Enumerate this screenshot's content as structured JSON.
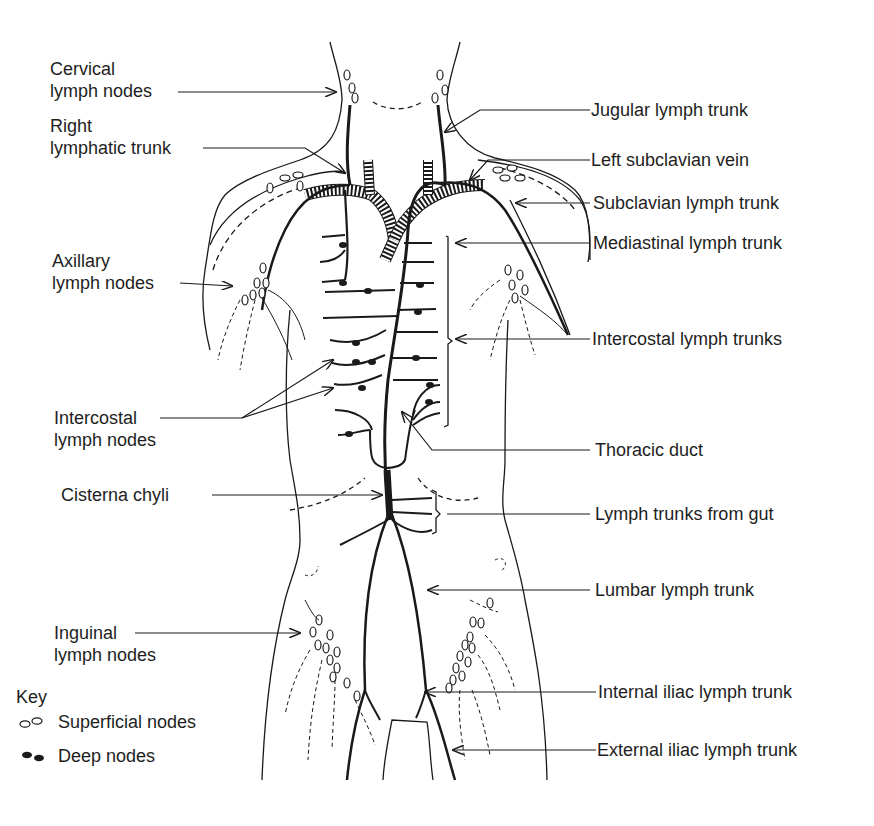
{
  "diagram": {
    "labels_left": [
      {
        "id": "cervical",
        "line1": "Cervical",
        "line2": "lymph nodes"
      },
      {
        "id": "right-lymphatic-trunk",
        "line1": "Right",
        "line2": "lymphatic trunk"
      },
      {
        "id": "axillary",
        "line1": "Axillary",
        "line2": "lymph nodes"
      },
      {
        "id": "intercostal-nodes",
        "line1": "Intercostal",
        "line2": "lymph nodes"
      },
      {
        "id": "cisterna-chyli",
        "line1": "Cisterna chyli"
      },
      {
        "id": "inguinal",
        "line1": "Inguinal",
        "line2": "lymph nodes"
      }
    ],
    "labels_right": [
      {
        "id": "jugular",
        "text": "Jugular lymph trunk"
      },
      {
        "id": "left-subclavian-vein",
        "text": "Left subclavian vein"
      },
      {
        "id": "subclavian-trunk",
        "text": "Subclavian lymph trunk"
      },
      {
        "id": "mediastinal",
        "text": "Mediastinal lymph trunk"
      },
      {
        "id": "intercostal-trunks",
        "text": "Intercostal lymph trunks"
      },
      {
        "id": "thoracic-duct",
        "text": "Thoracic duct"
      },
      {
        "id": "gut-trunks",
        "text": "Lymph trunks from gut"
      },
      {
        "id": "lumbar",
        "text": "Lumbar lymph trunk"
      },
      {
        "id": "internal-iliac",
        "text": "Internal iliac lymph trunk"
      },
      {
        "id": "external-iliac",
        "text": "External iliac lymph trunk"
      }
    ],
    "key": {
      "title": "Key",
      "items": [
        {
          "symbol": "open-oval-icon",
          "label": "Superficial nodes"
        },
        {
          "symbol": "filled-oval-icon",
          "label": "Deep nodes"
        }
      ]
    },
    "colors": {
      "ink": "#1a1a1a",
      "background": "#ffffff"
    }
  }
}
